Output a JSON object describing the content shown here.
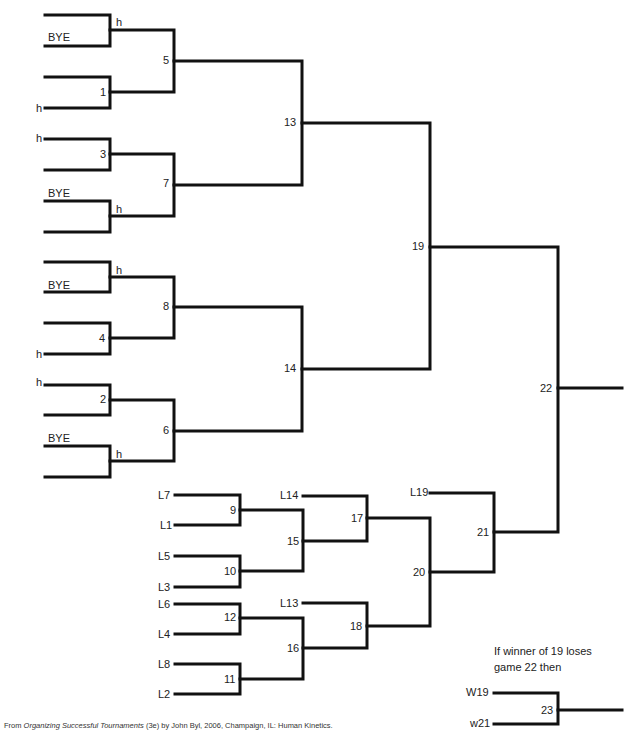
{
  "diagram": {
    "type": "double-elimination tournament bracket",
    "winners_bracket": {
      "first_round": [
        {
          "game": "1",
          "top": "",
          "bottom": "h"
        },
        {
          "game": "3",
          "top": "h",
          "bottom": ""
        },
        {
          "game": "4",
          "top": "",
          "bottom": "h"
        },
        {
          "game": "2",
          "top": "h",
          "bottom": ""
        }
      ],
      "byes": [
        {
          "game": "5",
          "slot_top": "",
          "slot_bottom": "BYE",
          "marker": "h"
        },
        {
          "game": "7",
          "slot_top": "BYE",
          "slot_bottom": "",
          "marker": "h"
        },
        {
          "game": "8",
          "slot_top": "",
          "slot_bottom": "BYE",
          "marker": "h"
        },
        {
          "game": "6",
          "slot_top": "BYE",
          "slot_bottom": "",
          "marker": "h"
        }
      ],
      "games": [
        "5",
        "1",
        "3",
        "7",
        "8",
        "4",
        "2",
        "6",
        "13",
        "14",
        "19"
      ]
    },
    "losers_bracket": {
      "entries": [
        "L7",
        "L1",
        "L5",
        "L3",
        "L6",
        "L4",
        "L8",
        "L2",
        "L14",
        "L13",
        "L19"
      ],
      "games": [
        "9",
        "10",
        "12",
        "11",
        "15",
        "16",
        "17",
        "18",
        "20",
        "21"
      ]
    },
    "final": {
      "game": "22"
    },
    "if_game": {
      "note_line1": "If winner of 19 loses",
      "note_line2": "game 22 then",
      "top": "W19",
      "bottom": "w21",
      "game": "23"
    },
    "labels": {
      "h": "h",
      "bye": "BYE",
      "g1": "1",
      "g2": "2",
      "g3": "3",
      "g4": "4",
      "g5": "5",
      "g6": "6",
      "g7": "7",
      "g8": "8",
      "g9": "9",
      "g10": "10",
      "g11": "11",
      "g12": "12",
      "g13": "13",
      "g14": "14",
      "g15": "15",
      "g16": "16",
      "g17": "17",
      "g18": "18",
      "g19": "19",
      "g20": "20",
      "g21": "21",
      "g22": "22",
      "g23": "23",
      "L7": "L7",
      "L1": "L1",
      "L5": "L5",
      "L3": "L3",
      "L6": "L6",
      "L4": "L4",
      "L8": "L8",
      "L2": "L2",
      "L14": "L14",
      "L13": "L13",
      "L19": "L19",
      "W19": "W19",
      "w21": "w21"
    }
  },
  "footer": {
    "prefix": "From ",
    "title": "Organizing Successful Tournaments",
    "suffix": " (3e) by John Byl, 2006, Champaign, IL: Human Kinetics."
  }
}
